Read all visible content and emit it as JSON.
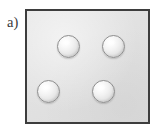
{
  "figure": {
    "panel_label": "a)",
    "description_kind": "schematic-diagram",
    "canvas": {
      "width": 163,
      "height": 137,
      "background": "#ffffff"
    },
    "box": {
      "fill_color": "#e2e2e2",
      "border_color": "#3d3d3d",
      "border_width": 2.5,
      "x": 25,
      "y": 9,
      "width": 125,
      "height": 115
    },
    "spheres": [
      {
        "name": "sphere-top-left",
        "cx": 68,
        "cy": 46,
        "diameter": 23,
        "fill_color": "#f0f0f0",
        "outline_color": "#8e8e8e"
      },
      {
        "name": "sphere-top-right",
        "cx": 113,
        "cy": 46,
        "diameter": 23,
        "fill_color": "#f0f0f0",
        "outline_color": "#8e8e8e"
      },
      {
        "name": "sphere-bottom-left",
        "cx": 48,
        "cy": 91,
        "diameter": 23,
        "fill_color": "#f0f0f0",
        "outline_color": "#8e8e8e"
      },
      {
        "name": "sphere-bottom-right",
        "cx": 103,
        "cy": 91,
        "diameter": 23,
        "fill_color": "#f0f0f0",
        "outline_color": "#8e8e8e"
      }
    ],
    "sphere_count": 4
  }
}
